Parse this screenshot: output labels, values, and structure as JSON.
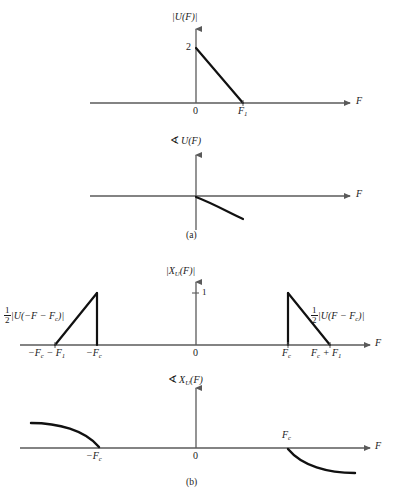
{
  "figure": {
    "caption_a": "(a)",
    "caption_b": "(b)",
    "axis_label_F": "F"
  },
  "chart_data": {
    "type": "line",
    "xlabel": "F",
    "grid": false,
    "legend": null,
    "panels": [
      {
        "id": "panel-a-magnitude",
        "title": "|U(F)|",
        "ylabel": "|U(F)|",
        "xlabel": "F",
        "y_ticks": [
          {
            "value": 2,
            "label": "2"
          }
        ],
        "x_ticks": [
          {
            "value": 0,
            "label": "0"
          },
          {
            "value": 1,
            "label": "F₁"
          }
        ],
        "series": [
          {
            "name": "magnitude-ramp",
            "type": "line",
            "x": [
              0,
              1
            ],
            "y": [
              2,
              0
            ]
          }
        ],
        "xlim": [
          -2.3,
          2.0
        ],
        "ylim": [
          0,
          2.4
        ]
      },
      {
        "id": "panel-a-phase",
        "title": "∠U(F)",
        "ylabel": "∠U(F)",
        "xlabel": "F",
        "y_ticks": [],
        "x_ticks": [],
        "series": [
          {
            "name": "phase-curve",
            "type": "line",
            "x": [
              0.0,
              0.25,
              0.5,
              0.75,
              1.0
            ],
            "y": [
              0.0,
              -0.22,
              -0.48,
              -0.72,
              -0.86
            ]
          }
        ],
        "xlim": [
          -2.3,
          2.0
        ],
        "ylim": [
          -1.2,
          1.0
        ]
      },
      {
        "id": "panel-b-magnitude",
        "title": "|Xⱼ(F)|",
        "ylabel": "|X_U(F)|",
        "xlabel": "F",
        "y_ticks": [
          {
            "value": 1,
            "label": "1"
          }
        ],
        "x_ticks": [
          {
            "value": -2,
            "label": "−F_c − F₁"
          },
          {
            "value": -1,
            "label": "−F_c"
          },
          {
            "value": 0,
            "label": "0"
          },
          {
            "value": 1,
            "label": "F_c"
          },
          {
            "value": 2,
            "label": "F_c + F₁"
          }
        ],
        "annotations": [
          {
            "id": "left-half-label",
            "text": "½|U(−F − F_c)|"
          },
          {
            "id": "right-half-label",
            "text": "½|U(F − F_c)|"
          }
        ],
        "series": [
          {
            "name": "left-triangle",
            "type": "line",
            "x": [
              -2,
              -1,
              -1
            ],
            "y": [
              0,
              1,
              0
            ]
          },
          {
            "name": "right-triangle",
            "type": "line",
            "x": [
              1,
              1,
              2
            ],
            "y": [
              0,
              1,
              0
            ]
          }
        ],
        "xlim": [
          -2.6,
          2.5
        ],
        "ylim": [
          0,
          1.3
        ]
      },
      {
        "id": "panel-b-phase",
        "title": "∠Xⱼ(F)",
        "ylabel": "∠X_U(F)",
        "xlabel": "F",
        "y_ticks": [],
        "x_ticks": [
          {
            "value": -1,
            "label": "−F_c"
          },
          {
            "value": 0,
            "label": "0"
          },
          {
            "value": 1,
            "label": "F_c"
          }
        ],
        "series": [
          {
            "name": "left-phase-curve",
            "type": "line",
            "x": [
              -2.0,
              -1.75,
              -1.5,
              -1.25,
              -1.0
            ],
            "y": [
              0.86,
              0.8,
              0.68,
              0.45,
              0.0
            ]
          },
          {
            "name": "right-phase-curve",
            "type": "line",
            "x": [
              1.0,
              1.25,
              1.5,
              1.75,
              2.0
            ],
            "y": [
              0.0,
              -0.45,
              -0.68,
              -0.8,
              -0.86
            ]
          }
        ],
        "xlim": [
          -2.6,
          2.5
        ],
        "ylim": [
          -1.2,
          1.2
        ]
      }
    ]
  },
  "labels": {
    "panel_a_mag_title_pre": "|U(",
    "panel_a_mag_y_2": "2",
    "panel_a_mag_x_0": "0",
    "panel_a_mag_x_F1_base": "F",
    "panel_a_mag_x_F1_sub": "1",
    "axis_F": "F",
    "panel_b_mag_y_1": "1",
    "panel_b_zero": "0",
    "panel_b_phase_zero": "0"
  },
  "colors": {
    "axis": "#5a5a5a",
    "curve": "#111111",
    "text": "#1a1a1a",
    "background": "#ffffff"
  }
}
